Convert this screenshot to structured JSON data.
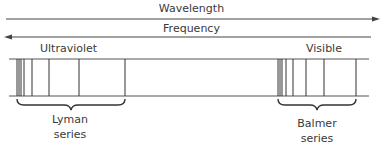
{
  "diagram": {
    "wavelength_label": "Wavelength",
    "frequency_label": "Frequency",
    "region_left_label": "Ultraviolet",
    "region_right_label": "Visible",
    "series_left": {
      "line1": "Lyman",
      "line2": "series"
    },
    "series_right": {
      "line1": "Balmer",
      "line2": "series"
    },
    "lyman_lines_x": [
      17,
      19,
      21,
      24,
      32,
      49,
      79,
      125
    ],
    "balmer_lines_x": [
      278,
      280,
      282,
      286,
      293,
      306,
      324,
      356
    ],
    "line_color": "#333333"
  }
}
